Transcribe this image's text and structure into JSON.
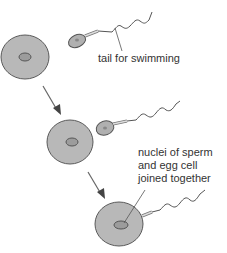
{
  "diagram": {
    "colors": {
      "cell_fill": "#b5b5b5",
      "cell_stroke": "#555555",
      "nucleus_fill": "#9a9a9a",
      "line": "#555555",
      "arrow": "#555555",
      "text": "#333333"
    },
    "labels": {
      "tail": "tail for swimming",
      "nuclei_line1": "nuclei of sperm",
      "nuclei_line2": "and egg cell",
      "nuclei_line3": "joined together"
    },
    "stages": [
      {
        "name": "egg and sperm separate"
      },
      {
        "name": "sperm reaches egg"
      },
      {
        "name": "nuclei joined"
      }
    ]
  }
}
